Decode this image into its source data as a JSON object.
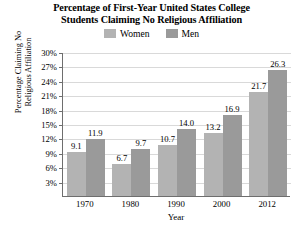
{
  "chart_data": {
    "type": "bar",
    "title": "Percentage of First-Year United States College Students Claiming No Religious Affiliation",
    "title_line1": "Percentage of First-Year United States College",
    "title_line2": "Students Claiming No Religious Affiliation",
    "xlabel": "Year",
    "ylabel": "Percentage Claiming No Religious Affiliation",
    "ylabel_line1": "Percentage Claiming No",
    "ylabel_line2": "Religious Affiliation",
    "categories": [
      "1970",
      "1980",
      "1990",
      "2000",
      "2012"
    ],
    "series": [
      {
        "name": "Women",
        "color": "#b3b3b3",
        "values": [
          9.1,
          6.7,
          10.7,
          13.2,
          21.7
        ],
        "labels": [
          "9.1",
          "6.7",
          "10.7",
          "13.2",
          "21.7"
        ]
      },
      {
        "name": "Men",
        "color": "#9a9a9a",
        "values": [
          11.9,
          9.7,
          14.0,
          16.9,
          26.3
        ],
        "labels": [
          "11.9",
          "9.7",
          "14.0",
          "16.9",
          "26.3"
        ]
      }
    ],
    "ylim": [
      0,
      30
    ],
    "ytick_values": [
      3,
      6,
      9,
      12,
      15,
      18,
      21,
      24,
      27,
      30
    ],
    "ytick_labels": [
      "3%",
      "6%",
      "9%",
      "12%",
      "15%",
      "18%",
      "21%",
      "24%",
      "27%",
      "30%"
    ],
    "grid": true,
    "legend_position": "top-center",
    "legend_entries": [
      "Women",
      "Men"
    ],
    "axis_color": "#6e6e6e",
    "grid_color": "#d9d9d9"
  }
}
